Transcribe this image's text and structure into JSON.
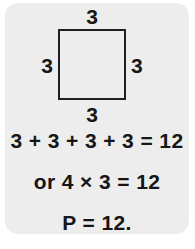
{
  "card": {
    "background_color": "#ededed",
    "ink_color": "#161616"
  },
  "figure": {
    "shape_name": "square",
    "outline_color": "#1f1f1f",
    "side_labels": {
      "top": "3",
      "right": "3",
      "bottom": "3",
      "left": "3"
    }
  },
  "equations": {
    "sum": "3 + 3 + 3 + 3 = 12",
    "product": "or 4 × 3 = 12",
    "result": "P = 12."
  }
}
